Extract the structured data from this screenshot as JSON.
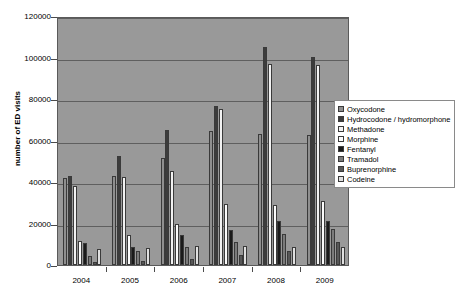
{
  "chart_data": {
    "type": "bar",
    "title": "",
    "subtitle": "",
    "xlabel": "",
    "ylabel": "number of ED visits",
    "categories": [
      "2004",
      "2005",
      "2006",
      "2007",
      "2008",
      "2009"
    ],
    "ylim": [
      0,
      120000
    ],
    "ytick_values": [
      0,
      20000,
      40000,
      60000,
      80000,
      100000,
      120000
    ],
    "ytick_labels": [
      "0",
      "20000",
      "40000",
      "60000",
      "80000",
      "100000",
      "120000"
    ],
    "grid": true,
    "legend_position": "right",
    "plot_background": "#999999",
    "series": [
      {
        "name": "Oxycodone",
        "color": "#8f8f8f",
        "values": [
          41800,
          42800,
          51500,
          64500,
          63000,
          62700
        ]
      },
      {
        "name": "Hydrocodone / hydromorphone",
        "color": "#3c3c3c",
        "values": [
          43000,
          52400,
          65200,
          76500,
          105200,
          100100
        ]
      },
      {
        "name": "Methadone",
        "color": "#f2f2f2",
        "values": [
          37900,
          42400,
          45200,
          75200,
          96700,
          96300
        ]
      },
      {
        "name": "Morphine",
        "color": "#fbfbfb",
        "values": [
          11800,
          14600,
          19800,
          29500,
          28800,
          31100
        ]
      },
      {
        "name": "Fentanyl",
        "color": "#1a1a1a",
        "values": [
          10700,
          8900,
          14600,
          17000,
          21400,
          21300
        ]
      },
      {
        "name": "Tramadol",
        "color": "#7b7b7b",
        "values": [
          4300,
          6600,
          8800,
          11300,
          14800,
          17500
        ]
      },
      {
        "name": "Buprenorphine",
        "color": "#575757",
        "values": [
          1300,
          1900,
          2900,
          4700,
          7000,
          11300
        ]
      },
      {
        "name": "Codeine",
        "color": "#e0e0e0",
        "values": [
          7700,
          8100,
          9100,
          9400,
          8600,
          8800
        ]
      }
    ]
  },
  "legend": {
    "items": [
      {
        "label": "Oxycodone"
      },
      {
        "label": "Hydrocodone / hydromorphone"
      },
      {
        "label": "Methadone"
      },
      {
        "label": "Morphine"
      },
      {
        "label": "Fentanyl"
      },
      {
        "label": "Tramadol"
      },
      {
        "label": "Buprenorphine"
      },
      {
        "label": "Codeine"
      }
    ]
  }
}
